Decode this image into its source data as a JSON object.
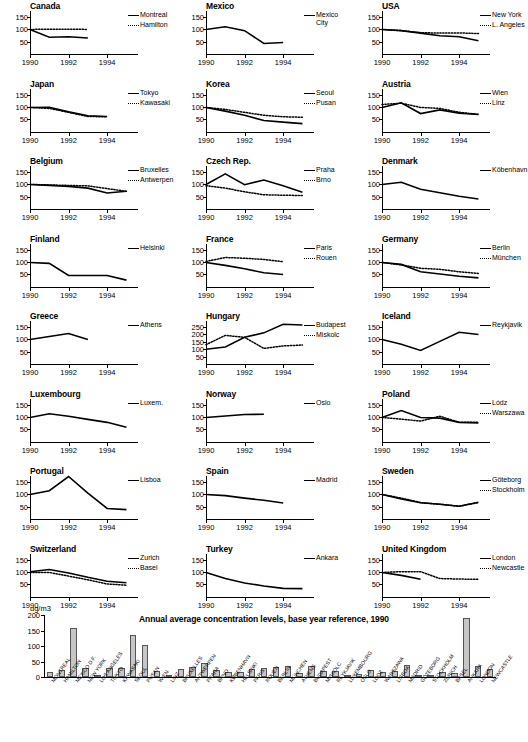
{
  "units_label": "ug/m3",
  "bar_title": "Annual average concentration levels, base year reference, 1990",
  "panel_axis": {
    "xticks": [
      1990,
      1992,
      1994
    ],
    "yticks_default": [
      50,
      100,
      150
    ],
    "yticks_hungary": [
      50,
      100,
      150,
      200,
      250
    ],
    "xlim": [
      1990,
      1995.6
    ],
    "ylim_default": [
      0,
      175
    ],
    "ylim_hungary": [
      0,
      290
    ]
  },
  "chart_data": {
    "type": "line",
    "xlabel": "",
    "ylabel": "index (1990 = 100)",
    "panels": [
      {
        "country": "Canada",
        "series": [
          {
            "name": "Montreal",
            "style": "solid",
            "x": [
              1990,
              1991,
              1992,
              1993
            ],
            "values": [
              100,
              68,
              70,
              65
            ]
          },
          {
            "name": "Hamilton",
            "style": "dotted",
            "x": [
              1990,
              1991,
              1992,
              1993
            ],
            "values": [
              100,
              101,
              101,
              100
            ]
          }
        ]
      },
      {
        "country": "Mexico",
        "series": [
          {
            "name": "Mexico City",
            "style": "solid",
            "x": [
              1990,
              1991,
              1992,
              1993,
              1994
            ],
            "values": [
              100,
              111,
              95,
              43,
              47
            ]
          }
        ]
      },
      {
        "country": "USA",
        "series": [
          {
            "name": "New York",
            "style": "solid",
            "x": [
              1990,
              1991,
              1992,
              1993,
              1994,
              1995
            ],
            "values": [
              100,
              95,
              85,
              74,
              70,
              54
            ]
          },
          {
            "name": "L. Angeles",
            "style": "dotted",
            "x": [
              1990,
              1991,
              1992,
              1993,
              1994,
              1995
            ],
            "values": [
              100,
              95,
              87,
              85,
              86,
              83
            ]
          }
        ]
      },
      {
        "country": "Japan",
        "series": [
          {
            "name": "Tokyo",
            "style": "solid",
            "x": [
              1990,
              1991,
              1992,
              1993,
              1994
            ],
            "values": [
              100,
              101,
              82,
              66,
              63
            ]
          },
          {
            "name": "Kawasaki",
            "style": "dotted",
            "x": [
              1990,
              1991,
              1992,
              1993,
              1994
            ],
            "values": [
              100,
              96,
              80,
              63,
              62
            ]
          }
        ]
      },
      {
        "country": "Korea",
        "series": [
          {
            "name": "Seoul",
            "style": "solid",
            "x": [
              1990,
              1991,
              1992,
              1993,
              1994,
              1995
            ],
            "values": [
              100,
              85,
              68,
              47,
              40,
              34
            ]
          },
          {
            "name": "Pusan",
            "style": "dotted",
            "x": [
              1990,
              1991,
              1992,
              1993,
              1994,
              1995
            ],
            "values": [
              100,
              92,
              80,
              68,
              62,
              60
            ]
          }
        ]
      },
      {
        "country": "Austria",
        "series": [
          {
            "name": "Wien",
            "style": "solid",
            "x": [
              1990,
              1991,
              1992,
              1993,
              1994,
              1995
            ],
            "values": [
              100,
              119,
              75,
              90,
              77,
              71
            ]
          },
          {
            "name": "Linz",
            "style": "dotted",
            "x": [
              1990,
              1991,
              1992,
              1993,
              1994,
              1995
            ],
            "values": [
              112,
              117,
              100,
              96,
              80,
              72
            ]
          }
        ]
      },
      {
        "country": "Belgium",
        "series": [
          {
            "name": "Bruxelles",
            "style": "solid",
            "x": [
              1990,
              1991,
              1992,
              1993,
              1994,
              1995
            ],
            "values": [
              100,
              96,
              92,
              85,
              65,
              72
            ]
          },
          {
            "name": "Antwerpen",
            "style": "dotted",
            "x": [
              1990,
              1991,
              1992,
              1993,
              1994,
              1995
            ],
            "values": [
              100,
              98,
              96,
              94,
              83,
              72
            ]
          }
        ]
      },
      {
        "country": "Czech Rep.",
        "series": [
          {
            "name": "Praha",
            "style": "solid",
            "x": [
              1990,
              1991,
              1992,
              1993,
              1994,
              1995
            ],
            "values": [
              100,
              143,
              99,
              118,
              95,
              68
            ]
          },
          {
            "name": "Brno",
            "style": "dotted",
            "x": [
              1990,
              1991,
              1992,
              1993,
              1994,
              1995
            ],
            "values": [
              95,
              85,
              70,
              58,
              56,
              55
            ]
          }
        ]
      },
      {
        "country": "Denmark",
        "series": [
          {
            "name": "Köbenhavn",
            "style": "solid",
            "x": [
              1990,
              1991,
              1992,
              1993,
              1994,
              1995
            ],
            "values": [
              100,
              109,
              80,
              66,
              52,
              41
            ]
          }
        ]
      },
      {
        "country": "Finland",
        "series": [
          {
            "name": "Helsinki",
            "style": "solid",
            "x": [
              1990,
              1991,
              1992,
              1993,
              1994,
              1995
            ],
            "values": [
              100,
              96,
              47,
              47,
              47,
              28
            ]
          }
        ]
      },
      {
        "country": "France",
        "series": [
          {
            "name": "Paris",
            "style": "solid",
            "x": [
              1990,
              1991,
              1992,
              1993,
              1994
            ],
            "values": [
              100,
              88,
              74,
              58,
              51
            ]
          },
          {
            "name": "Rouen",
            "style": "dotted",
            "x": [
              1990,
              1991,
              1992,
              1993,
              1994
            ],
            "values": [
              104,
              120,
              117,
              112,
              103
            ]
          }
        ]
      },
      {
        "country": "Germany",
        "series": [
          {
            "name": "Berlin",
            "style": "solid",
            "x": [
              1990,
              1991,
              1992,
              1993,
              1994,
              1995
            ],
            "values": [
              100,
              92,
              62,
              53,
              44,
              37
            ]
          },
          {
            "name": "München",
            "style": "dotted",
            "x": [
              1990,
              1991,
              1992,
              1993,
              1994,
              1995
            ],
            "values": [
              100,
              90,
              76,
              72,
              62,
              55
            ]
          }
        ]
      },
      {
        "country": "Greece",
        "series": [
          {
            "name": "Athens",
            "style": "solid",
            "x": [
              1990,
              1991,
              1992,
              1993
            ],
            "values": [
              100,
              112,
              124,
              100
            ]
          }
        ]
      },
      {
        "country": "Hungary",
        "yscale": "hungary",
        "series": [
          {
            "name": "Budapest",
            "style": "solid",
            "x": [
              1990,
              1991,
              1992,
              1993,
              1994,
              1995
            ],
            "values": [
              100,
              115,
              180,
              210,
              268,
              263
            ]
          },
          {
            "name": "Miskolc",
            "style": "dotted",
            "x": [
              1990,
              1991,
              1992,
              1993,
              1994,
              1995
            ],
            "values": [
              130,
              193,
              180,
              105,
              122,
              128
            ]
          }
        ]
      },
      {
        "country": "Iceland",
        "series": [
          {
            "name": "Reykjavik",
            "style": "solid",
            "x": [
              1990,
              1991,
              1992,
              1993,
              1994,
              1995
            ],
            "values": [
              100,
              80,
              55,
              92,
              129,
              120
            ]
          }
        ]
      },
      {
        "country": "Luxembourg",
        "series": [
          {
            "name": "Luxem.",
            "style": "solid",
            "x": [
              1990,
              1991,
              1992,
              1993,
              1994,
              1995
            ],
            "values": [
              100,
              115,
              105,
              92,
              80,
              60
            ]
          }
        ]
      },
      {
        "country": "Norway",
        "series": [
          {
            "name": "Oslo",
            "style": "solid",
            "x": [
              1990,
              1991,
              1992,
              1993
            ],
            "values": [
              100,
              106,
              112,
              113
            ]
          }
        ]
      },
      {
        "country": "Poland",
        "series": [
          {
            "name": "Lódz",
            "style": "solid",
            "x": [
              1990,
              1991,
              1992,
              1993,
              1994,
              1995
            ],
            "values": [
              100,
              128,
              100,
              97,
              80,
              78
            ]
          },
          {
            "name": "Warszawa",
            "style": "dotted",
            "x": [
              1990,
              1991,
              1992,
              1993,
              1994,
              1995
            ],
            "values": [
              100,
              93,
              85,
              105,
              80,
              80
            ]
          }
        ]
      },
      {
        "country": "Portugal",
        "series": [
          {
            "name": "Lisboa",
            "style": "solid",
            "x": [
              1990,
              1991,
              1992,
              1993,
              1994,
              1995
            ],
            "values": [
              100,
              115,
              173,
              105,
              43,
              38
            ]
          }
        ]
      },
      {
        "country": "Spain",
        "series": [
          {
            "name": "Madrid",
            "style": "solid",
            "x": [
              1990,
              1991,
              1992,
              1993,
              1994
            ],
            "values": [
              100,
              95,
              85,
              76,
              65
            ]
          }
        ]
      },
      {
        "country": "Sweden",
        "series": [
          {
            "name": "Göteborg",
            "style": "solid",
            "x": [
              1990,
              1991,
              1992,
              1993,
              1994,
              1995
            ],
            "values": [
              100,
              82,
              66,
              60,
              52,
              68
            ]
          },
          {
            "name": "Stockholm",
            "style": "dotted",
            "x": [
              1990,
              1991,
              1992,
              1993,
              1994,
              1995
            ],
            "values": [
              100,
              85,
              67,
              60,
              52,
              67
            ]
          }
        ]
      },
      {
        "country": "Switzerland",
        "series": [
          {
            "name": "Zurich",
            "style": "solid",
            "x": [
              1990,
              1991,
              1992,
              1993,
              1994,
              1995
            ],
            "values": [
              103,
              112,
              98,
              80,
              64,
              58
            ]
          },
          {
            "name": "Basel",
            "style": "dotted",
            "x": [
              1990,
              1991,
              1992,
              1993,
              1994,
              1995
            ],
            "values": [
              100,
              100,
              85,
              70,
              53,
              48
            ]
          }
        ]
      },
      {
        "country": "Turkey",
        "series": [
          {
            "name": "Ankara",
            "style": "solid",
            "x": [
              1990,
              1991,
              1992,
              1993,
              1994,
              1995
            ],
            "values": [
              100,
              75,
              57,
              45,
              35,
              34
            ]
          }
        ]
      },
      {
        "country": "United Kingdom",
        "series": [
          {
            "name": "London",
            "style": "solid",
            "x": [
              1990,
              1991,
              1992
            ],
            "values": [
              100,
              88,
              72
            ]
          },
          {
            "name": "Newcastle",
            "style": "dotted",
            "x": [
              1990,
              1991,
              1992,
              1993,
              1994,
              1995
            ],
            "values": [
              100,
              103,
              103,
              75,
              73,
              72
            ]
          }
        ]
      }
    ]
  },
  "bar_chart_data": {
    "type": "bar",
    "title": "Annual average concentration levels, base year reference, 1990",
    "ylabel": "ug/m3",
    "ylim": [
      0,
      200
    ],
    "yticks": [
      0,
      50,
      100,
      150,
      200
    ],
    "categories": [
      "MONTREAL",
      "HAMILTON",
      "MEXICO D.F.",
      "NEW YORK",
      "LOS ANGELES",
      "TOKYO",
      "KAWASAKI",
      "SEOUL",
      "PUSAN",
      "WIEN",
      "LINZ",
      "BRUXELLES",
      "ANTWERPEN",
      "PRAHA",
      "BRNO",
      "KØBENHAVN",
      "HELSINKI",
      "PARIS",
      "ROUEN",
      "BERLIN",
      "MÜNCHEN",
      "ATHENS",
      "BUDAPEST",
      "MISKOLC",
      "REYKJAVIK",
      "LUXEMBOURG",
      "OSLO",
      "LÓDZ",
      "WARSZAWA",
      "LISBOA",
      "MADRID",
      "GÖTEBORG",
      "STOCKHOLM",
      "ZURICH",
      "BASEL",
      "ANKARA",
      "LONDON",
      "NEWCASTLE"
    ],
    "values": [
      15,
      24,
      157,
      28,
      8,
      28,
      28,
      136,
      102,
      19,
      8,
      26,
      31,
      44,
      22,
      17,
      15,
      27,
      28,
      31,
      37,
      12,
      35,
      19,
      20,
      3,
      10,
      22,
      15,
      18,
      40,
      8,
      6,
      15,
      13,
      190,
      34,
      27
    ]
  }
}
